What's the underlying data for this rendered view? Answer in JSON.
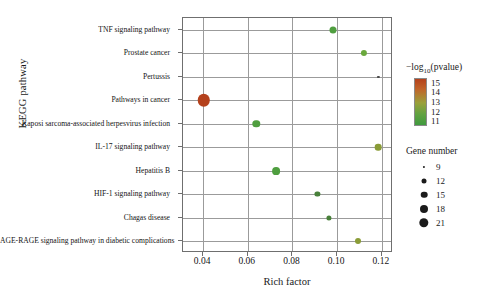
{
  "chart_data": {
    "type": "scatter",
    "title": "",
    "xlabel": "Rich factor",
    "ylabel": "KEGG pathway",
    "xlim": [
      0.031,
      0.125
    ],
    "xticks": [
      0.04,
      0.06,
      0.08,
      0.1,
      0.12
    ],
    "xticklabels": [
      "0.04",
      "0.06",
      "0.08",
      "0.10",
      "0.12"
    ],
    "grid": true,
    "categories": [
      "TNF signaling pathway",
      "Prostate cancer",
      "Pertussis",
      "Pathways in cancer",
      "Kaposi sarcoma-associated herpesvirus infection",
      "IL-17 signaling pathway",
      "Hepatitis B",
      "HIF-1 signaling pathway",
      "Chagas disease",
      "AGE-RAGE signaling pathway in diabetic complications"
    ],
    "points": [
      {
        "label": "TNF signaling pathway",
        "rich_factor": 0.098,
        "neglog10p": 11.6,
        "gene_number": 13,
        "color": "#4f9e3f",
        "size_px": 7.0
      },
      {
        "label": "Prostate cancer",
        "rich_factor": 0.112,
        "neglog10p": 11.3,
        "gene_number": 11,
        "color": "#6aa83c",
        "size_px": 6.2
      },
      {
        "label": "Pertussis",
        "rich_factor": 0.1185,
        "neglog10p": 11.0,
        "gene_number": 8,
        "color": "#4a4a4a",
        "size_px": 2.2
      },
      {
        "label": "Pathways in cancer",
        "rich_factor": 0.0402,
        "neglog10p": 15.0,
        "gene_number": 22,
        "color": "#b4411c",
        "size_px": 12.5
      },
      {
        "label": "Kaposi sarcoma-associated herpesvirus infection",
        "rich_factor": 0.0638,
        "neglog10p": 11.8,
        "gene_number": 14,
        "color": "#4f9e3f",
        "size_px": 7.4
      },
      {
        "label": "IL-17 signaling pathway",
        "rich_factor": 0.1185,
        "neglog10p": 11.4,
        "gene_number": 12,
        "color": "#8a9c37",
        "size_px": 6.6
      },
      {
        "label": "Hepatitis B",
        "rich_factor": 0.0728,
        "neglog10p": 12.2,
        "gene_number": 15,
        "color": "#4f9e3f",
        "size_px": 7.8
      },
      {
        "label": "HIF-1 signaling pathway",
        "rich_factor": 0.0912,
        "neglog10p": 11.2,
        "gene_number": 10,
        "color": "#48803a",
        "size_px": 5.2
      },
      {
        "label": "Chagas disease",
        "rich_factor": 0.0962,
        "neglog10p": 11.1,
        "gene_number": 10,
        "color": "#48803a",
        "size_px": 5.2
      },
      {
        "label": "AGE-RAGE signaling pathway in diabetic complications",
        "rich_factor": 0.1092,
        "neglog10p": 11.3,
        "gene_number": 11,
        "color": "#8a9c37",
        "size_px": 6.0
      }
    ],
    "legend_color": {
      "title_prefix": "−log",
      "title_sub": "10",
      "title_suffix": "(pvalue)",
      "ticks": [
        15,
        14,
        13,
        12,
        11
      ],
      "ticklabels": [
        "15",
        "14",
        "13",
        "12",
        "11"
      ],
      "gradient_top": "#b4411c",
      "gradient_bottom": "#3f9a3f",
      "position": "right"
    },
    "legend_size": {
      "title": "Gene number",
      "values": [
        9,
        12,
        15,
        18,
        21
      ],
      "labels": [
        "9",
        "12",
        "15",
        "18",
        "21"
      ],
      "dot_px": [
        2.2,
        5.0,
        6.6,
        8.0,
        9.4
      ],
      "position": "right"
    }
  }
}
